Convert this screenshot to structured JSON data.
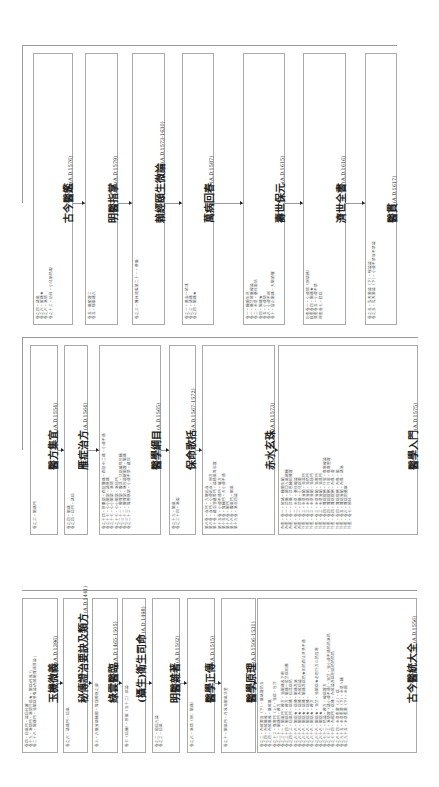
{
  "rows": [
    {
      "name": "top-row",
      "books": [
        {
          "title": "古今醫鑑",
          "date": "(A.D.1576)",
          "entries": [
            "卷之四・諸氣",
            "卷之六・脇痛★",
            "卷之八・淋閉",
            "卷之十三・幼科・小兒胎熱眼"
          ]
        },
        {
          "title": "明醫指掌",
          "date": "(A.D.1579)",
          "entries": [
            "卷五・脈鬱證三",
            "卷五・喘脹痛六"
          ]
        },
        {
          "title": "賴經頤生微論",
          "date": "(A.D.1573-1630)",
          "entries": [
            "卷之三・醫林滄鑑第二十・・華脈"
          ]
        },
        {
          "title": "萬病回春",
          "date": "(A.D.1587)",
          "entries": [
            "卷之一・萬金一統述",
            "卷之三・諸痛",
            "卷之四・腸痛★"
          ]
        },
        {
          "title": "壽世保元",
          "date": "(A.D.1615)",
          "entries": [
            "卷一・臟腑生死",
            "卷一・脈法經脈總論",
            "卷二・本草・藥性歌括",
            "卷四・陽痛★",
            "卷五・小便閉",
            "卷八・小便不利",
            "卷十・當止腸痛・大腸頭癰"
          ]
        },
        {
          "title": "濟世全書",
          "date": "(A.D.1616)",
          "entries": [
            "坎集卷一・小便閉（附關格）",
            "艮集卷四・腸痛★",
            "巽集卷五・小便不禁",
            "坤集卷七・殿症"
          ]
        },
        {
          "title": "醫貫",
          "date": "(A.D.1617)",
          "entries": [
            "卷之五・先天要論（下）・喘論論",
            "卷之五・先天要論（下）・小便不禁並不禁論"
          ]
        }
      ]
    },
    {
      "name": "middle-row",
      "books": [
        {
          "title": "醫方集宜",
          "date": "(A.D.1554)",
          "entries": [
            "卷之三・腸痛門"
          ]
        },
        {
          "title": "雁症治方",
          "date": "(A.D.1564)",
          "entries": [
            "卷之四・腸痛",
            "卷之四・疝門・諸疝"
          ]
        },
        {
          "title": "醫學綱目",
          "date": "(A.D.1565)",
          "entries": [
            "卷之十四・肝膽部・而陰腫痛・而陰中二痛・小便不通",
            "卷之十七・心小腸部・諸脅痛",
            "卷之十七・心小腸部・淋閉",
            "卷之十七・心小腸部・淋秘門",
            "卷之二十一・脾胃部・腹滿・只病能化於臟",
            "卷之二十二・脾胃部・嘔吐痰嗽膈證・腸痛",
            "卷之二十三・腎膀胱部・小便不禁・遺尿"
          ]
        },
        {
          "title": "保命歌括",
          "date": "(A.D.1567-1572)",
          "entries": [
            "卷之十九・腸氣",
            "卷之三十四・淋濁"
          ]
        },
        {
          "title": "赤水玄珠",
          "date": "(A.D.1573)",
          "entries": [
            "第八卷・血門・九竅出血",
            "第八卷・血門・小便出血・附方",
            "第十卷・遺溺溲遺等門・論精氣等溺證",
            "第十五卷・小便不通門・癃方",
            "第十五卷・腎臟門・大小便不通",
            "第十八卷・腸門",
            "第十八卷・腹氣門・腸氣",
            "第十九卷・淋溺四論"
          ]
        },
        {
          "title": "醫學入門",
          "date": "(A.D.1575)",
          "entries": [
            "內集・卷一・經絡・臟腑生類",
            "內集・卷一・診脈・觀口入氣觀臟",
            "內集・卷一・診脈・診色臟相機證",
            "內集・卷二・本草・藥性總論",
            "內集・卷一・診脈・小兒病要",
            "外集・卷三・本草分類・治濕門",
            "外集・卷三・本草分類・治熱門",
            "外集・卷三・本草分類・治燥門",
            "外集・卷三・本草分類・治寒門",
            "外集・卷三・本草分類・治風門",
            "外集・卷四・雜病提綱・外感・傷寒總論",
            "外集・卷四・雜病提綱・外感・傷寒變證",
            "外集・卷四・雜病提綱・內傷・虛",
            "外集・卷四・雜病提綱・內傷・脹",
            "外集・卷五・雜病分類・內傷・諸淋",
            "外集・卷六・雜病用藥賦",
            "外集・卷七・婦科"
          ]
        }
      ]
    },
    {
      "name": "bottom-row",
      "books": [
        {
          "title": "玉機微義",
          "date": "(A.D.1396)",
          "entries": [
            "卷四・疝氣門・論疝杵屠",
            "卷十九・淋閉門・淋閉外病★・腸病(丹溪?)",
            "卷二十八・陽痛門・治腸病參有論(內經腸胃補質論)"
          ]
        },
        {
          "title": "秘傳證治要訣及類方",
          "date": "(A.D.1441)",
          "entries": [
            "卷之六・諸痛門・疝氣"
          ]
        },
        {
          "title": "綠雲醫臨",
          "date": "(A.D.1465-1505)",
          "entries": [
            "卷上・六脈分屬臟腑・腎與膀胱之屬"
          ]
        },
        {
          "title": "(攝生)衛生司命",
          "date": "(A.D.1498)",
          "entries": [
            "卷七（疝偏）・肝脹（五十二）病論"
          ]
        },
        {
          "title": "明醫雜著",
          "date": "(A.D.1502)",
          "entries": [
            "卷之二・和疝九論",
            "卷之三・疝氣"
          ]
        },
        {
          "title": "醫學正傳",
          "date": "(A.D.1515)",
          "entries": [
            "卷之六・淋閉（附：腸痛）"
          ]
        },
        {
          "title": "醫學原理",
          "date": "(A.D.1506-1531)",
          "entries": [
            "卷之十・腸氣門・丹溪治腸氣活套"
          ]
        },
        {
          "title": "古今醫統大全",
          "date": "(A.D.1556)",
          "entries": [
            "卷之二・內經要旨（下）・脈絡證熱五",
            "卷之四・內經脈候・",
            "卷之四・內經脈候・脈經脈",
            "卷之十三・傷寒門（上）・治病・吐汗",
            "卷之二十・腸痛門・療方",
            "卷之三十一・腸氣門・療方・治腸痛及下痢",
            "卷之三十四・腸病門・療方・腸痛一般法病相薦",
            "卷之四十三・疝氣門・病機・疝滿病熱",
            "卷之六十八・腸病★・病機・腸痛為淋",
            "卷之六十八・腸病★・病機・內經疝論",
            "卷之六十八・腸病★・病機・腸痛為病熱★因熱而沈泄洪不通",
            "卷之六十八・腸病★・病機・",
            "卷之六十八・腸病★・療方",
            "卷之六十八・腸病★・治法・治腸病★必用外方以熱其寒",
            "卷之六十八・腸病★",
            "卷之七十二・熱論・療方・總病證方",
            "卷之七十三・淋閉證（諸小便不通）・治法・治小便不通熱熱淋熱",
            "卷之七十四・內國門・病機・內經論為病則病熱熱熱熱",
            "卷之八十四・本草集要（上）・病",
            "卷之九十五・本草集要（下）・本草入臟",
            "卷之九十五・本草集要（下）・本國"
          ]
        }
      ]
    }
  ]
}
